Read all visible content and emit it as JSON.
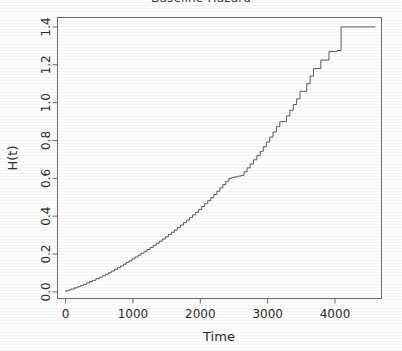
{
  "chart_data": {
    "type": "line",
    "title": "Baseline Hazard",
    "xlabel": "Time",
    "ylabel": "H(t)",
    "xlim": [
      -120,
      4690
    ],
    "ylim": [
      -0.035,
      1.45
    ],
    "xticks": [
      0,
      1000,
      2000,
      3000,
      4000
    ],
    "xtick_labels": [
      "0",
      "1000",
      "2000",
      "3000",
      "4000"
    ],
    "yticks": [
      0.0,
      0.2,
      0.4,
      0.6,
      0.8,
      1.0,
      1.2,
      1.4
    ],
    "ytick_labels": [
      "0.0",
      "0.2",
      "0.4",
      "0.6",
      "0.8",
      "1.0",
      "1.2",
      "1.4"
    ],
    "grid": false,
    "legend": null,
    "line_color": "#5a5a5a",
    "axis_color": "#6b6b6b",
    "background_color": "#fdfdfd",
    "series": [
      {
        "name": "Cumulative baseline hazard",
        "step": "post",
        "x": [
          0,
          40,
          80,
          130,
          175,
          220,
          265,
          310,
          355,
          400,
          450,
          500,
          545,
          590,
          635,
          680,
          725,
          770,
          815,
          860,
          900,
          940,
          985,
          1030,
          1075,
          1120,
          1165,
          1210,
          1255,
          1300,
          1345,
          1390,
          1435,
          1480,
          1525,
          1570,
          1615,
          1660,
          1705,
          1750,
          1795,
          1840,
          1885,
          1930,
          1975,
          2020,
          2065,
          2110,
          2155,
          2200,
          2245,
          2290,
          2335,
          2380,
          2425,
          2470,
          2515,
          2560,
          2605,
          2650,
          2695,
          2740,
          2790,
          2840,
          2890,
          2935,
          2980,
          3030,
          3080,
          3130,
          3180,
          3230,
          3280,
          3330,
          3380,
          3430,
          3480,
          3530,
          3580,
          3630,
          3680,
          3730,
          3790,
          3850,
          3910,
          3970,
          4030,
          4090,
          4150,
          4210,
          4270,
          4330,
          4600
        ],
        "y": [
          0.005,
          0.01,
          0.015,
          0.021,
          0.027,
          0.033,
          0.04,
          0.047,
          0.054,
          0.061,
          0.069,
          0.077,
          0.085,
          0.093,
          0.101,
          0.11,
          0.119,
          0.128,
          0.137,
          0.146,
          0.155,
          0.164,
          0.174,
          0.184,
          0.194,
          0.204,
          0.214,
          0.224,
          0.235,
          0.246,
          0.257,
          0.268,
          0.279,
          0.291,
          0.303,
          0.315,
          0.327,
          0.34,
          0.353,
          0.366,
          0.379,
          0.393,
          0.407,
          0.421,
          0.436,
          0.451,
          0.466,
          0.482,
          0.498,
          0.515,
          0.532,
          0.549,
          0.567,
          0.585,
          0.6,
          0.605,
          0.608,
          0.612,
          0.616,
          0.635,
          0.655,
          0.676,
          0.698,
          0.72,
          0.743,
          0.767,
          0.792,
          0.818,
          0.845,
          0.873,
          0.9,
          0.9,
          0.93,
          0.96,
          0.99,
          1.02,
          1.06,
          1.06,
          1.1,
          1.14,
          1.18,
          1.18,
          1.225,
          1.225,
          1.27,
          1.27,
          1.275,
          1.4,
          1.4,
          1.4,
          1.4,
          1.4,
          1.4
        ]
      }
    ]
  },
  "axes": {
    "title": "Baseline Hazard",
    "x_label": "Time",
    "y_label": "H(t)"
  }
}
